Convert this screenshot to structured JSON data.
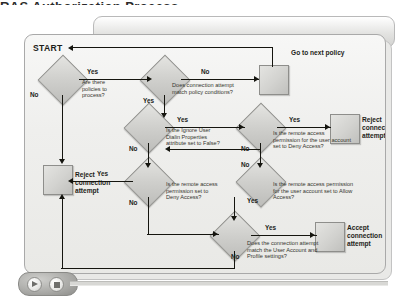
{
  "page": {
    "title_remnant": "RAS Authorization Process"
  },
  "diagram": {
    "start_label": "START",
    "go_next_policy_label": "Go to next policy",
    "nodes": [
      {
        "id": "d1",
        "type": "decision",
        "text": "Are there\npolicies to\nprocess?"
      },
      {
        "id": "d2",
        "type": "decision",
        "text": "Does connection attempt\nmatch policy conditions?"
      },
      {
        "id": "d3",
        "type": "decision",
        "text": "Is the Ignore User\nDialin Properties\nattribute set to False?"
      },
      {
        "id": "d4",
        "type": "decision",
        "text": "Is the remote access\npermission for the user account\nset to Deny Access?"
      },
      {
        "id": "d5",
        "type": "decision",
        "text": "Is the remote access\npermission set to\nDeny Access?"
      },
      {
        "id": "d6",
        "type": "decision",
        "text": "Is the remote access permission\nfor the user account set to Allow\nAccess?"
      },
      {
        "id": "d7",
        "type": "decision",
        "text": "Does the connection attempt\nmatch the User Account and\nProfile settings?"
      },
      {
        "id": "b_next",
        "type": "process",
        "text": ""
      },
      {
        "id": "b_reject_left",
        "type": "process",
        "text": "Reject\nconnection\nattempt"
      },
      {
        "id": "b_reject_right",
        "type": "process",
        "text": "Reject\nconnection\nattempt"
      },
      {
        "id": "b_accept",
        "type": "process",
        "text": "Accept\nconnection\nattempt"
      }
    ],
    "edge_labels": {
      "d1_yes": "Yes",
      "d1_no": "No",
      "d2_no": "No",
      "d2_yes": "Yes",
      "d3_yes": "Yes",
      "d3_no": "No",
      "d4_yes": "Yes",
      "d4_no": "No",
      "d5_yes": "Yes",
      "d5_no": "No",
      "d6_yes": "Yes",
      "d6_no": "No",
      "d7_yes": "Yes",
      "d7_no": "No"
    }
  },
  "player": {
    "play_label": "play",
    "stop_label": "stop"
  },
  "colors": {
    "line": "#15150f",
    "node_fill": "#d2d2cf",
    "node_border": "#8e8e8b",
    "canvas": "#efefed"
  }
}
